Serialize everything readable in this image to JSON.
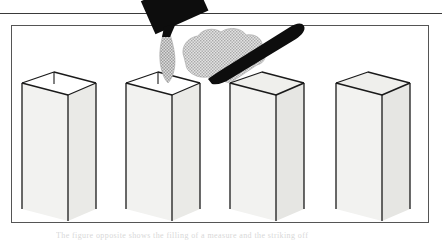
{
  "figure": {
    "border_color": "#555555",
    "rule_color": "#3a3a3a",
    "ink_color": "#1a1a1a",
    "face_light": "#f2f2f0",
    "face_mid": "#ebebe8",
    "face_dark": "#e2e2df",
    "granular_color": "#b9b9b9",
    "tool_color": "#0d0d0d",
    "caption_partial": "The figure opposite shows the filling of a measure and the striking off"
  },
  "panels": [
    {
      "index": 1,
      "name": "empty-open-measure",
      "label": "Empty open-top measure",
      "step_text": "1"
    },
    {
      "index": 2,
      "name": "pouring-material",
      "label": "Pouring material from scoop into measure",
      "step_text": "2"
    },
    {
      "index": 3,
      "name": "striking-off",
      "label": "Striking off excess with a straight-edge",
      "step_text": "3"
    },
    {
      "index": 4,
      "name": "filled-level-measure",
      "label": "Filled and levelled measure",
      "step_text": "4"
    }
  ],
  "objects": {
    "scoop_label": "black scoop",
    "straightedge_label": "straight-edge rod",
    "heap_label": "heaped granular material",
    "stream_label": "falling granular stream"
  }
}
